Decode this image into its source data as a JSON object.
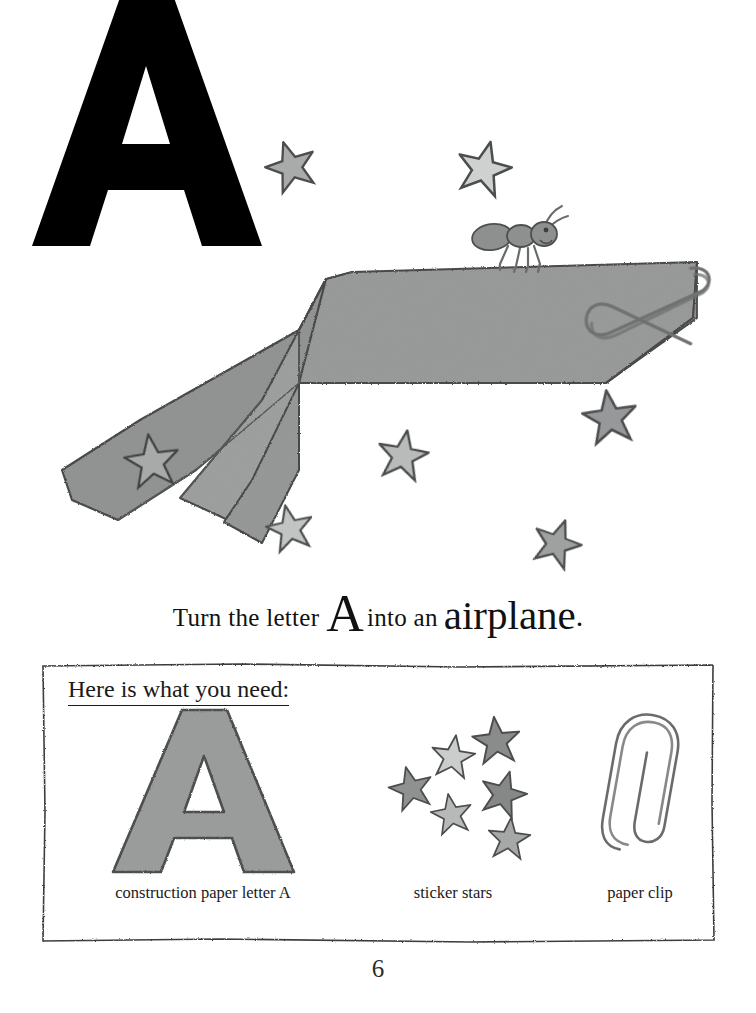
{
  "page": {
    "letter": "A",
    "page_number": "6",
    "background_color": "#ffffff"
  },
  "caption": {
    "part1": "Turn the letter",
    "letter": "A",
    "part2": "into an",
    "word": "airplane",
    "period": "."
  },
  "supplies": {
    "heading": "Here is what you need:",
    "items": [
      {
        "name": "construction-paper-letter",
        "label": "construction paper letter A",
        "icon": "letter-a-cutout-icon",
        "color": "#9a9b9b"
      },
      {
        "name": "sticker-stars",
        "label": "sticker stars",
        "icon": "star-cluster-icon",
        "color": "#9a9b9b"
      },
      {
        "name": "paper-clip",
        "label": "paper clip",
        "icon": "paper-clip-icon",
        "color": "#ffffff"
      }
    ]
  },
  "illustration": {
    "name": "paper-airplane-scene",
    "airplane_color": "#9a9b9b",
    "outline_color": "#4a4a4a",
    "ant": {
      "name": "ant-icon",
      "color": "#8e8f8f"
    },
    "paper_clip": {
      "name": "paper-clip-icon",
      "color": "#7d7e7e"
    },
    "wing_star": {
      "name": "star-icon",
      "color": "#a8a9a9"
    },
    "stars": [
      {
        "cx": 291,
        "cy": 166,
        "r": 26,
        "fill": "#a9aaaa",
        "rot": -18
      },
      {
        "cx": 484,
        "cy": 168,
        "r": 28,
        "fill": "#cfd0d0",
        "rot": 14
      },
      {
        "cx": 610,
        "cy": 417,
        "r": 28,
        "fill": "#96989a",
        "rot": -8
      },
      {
        "cx": 403,
        "cy": 455,
        "r": 26,
        "fill": "#b9baba",
        "rot": 10
      },
      {
        "cx": 290,
        "cy": 528,
        "r": 24,
        "fill": "#c2c3c3",
        "rot": -12
      },
      {
        "cx": 557,
        "cy": 543,
        "r": 25,
        "fill": "#9fa0a0",
        "rot": 20
      }
    ]
  },
  "supply_star_cluster": [
    {
      "cx": 90,
      "cy": 100,
      "r": 32,
      "fill": "#8f9191",
      "rot": -14
    },
    {
      "cx": 150,
      "cy": 55,
      "r": 32,
      "fill": "#cbcccc",
      "rot": 8
    },
    {
      "cx": 212,
      "cy": 32,
      "r": 35,
      "fill": "#8a8c8c",
      "rot": -6
    },
    {
      "cx": 222,
      "cy": 108,
      "r": 34,
      "fill": "#868888",
      "rot": 16
    },
    {
      "cx": 148,
      "cy": 137,
      "r": 30,
      "fill": "#b7b8b8",
      "rot": -10
    },
    {
      "cx": 230,
      "cy": 172,
      "r": 31,
      "fill": "#a6a7a7",
      "rot": 6
    }
  ]
}
